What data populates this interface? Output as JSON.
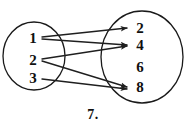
{
  "figure": {
    "caption": "7.",
    "background_color": "#ffffff",
    "ink_color": "#1a1a1a"
  },
  "domain_set": {
    "name": "domain-oval",
    "items": [
      {
        "label": "1",
        "x": 33,
        "y": 38
      },
      {
        "label": "2",
        "x": 33,
        "y": 60
      },
      {
        "label": "3",
        "x": 33,
        "y": 78
      }
    ],
    "ellipse": {
      "cx": 34,
      "cy": 56,
      "rx": 31,
      "ry": 34
    }
  },
  "codomain_set": {
    "name": "codomain-oval",
    "items": [
      {
        "label": "2",
        "x": 140,
        "y": 28
      },
      {
        "label": "4",
        "x": 140,
        "y": 45
      },
      {
        "label": "6",
        "x": 140,
        "y": 67
      },
      {
        "label": "8",
        "x": 140,
        "y": 87
      }
    ],
    "ellipse": {
      "cx": 142,
      "cy": 57,
      "rx": 41,
      "ry": 46
    }
  },
  "chart_data": {
    "type": "diagram",
    "title": "7.",
    "subtype": "arrow-mapping-diagram",
    "domain": [
      "1",
      "2",
      "3"
    ],
    "codomain": [
      "2",
      "4",
      "6",
      "8"
    ],
    "mappings": [
      {
        "from": "1",
        "to": "2",
        "x1": 42,
        "y1": 37,
        "x2": 127,
        "y2": 28
      },
      {
        "from": "1",
        "to": "4",
        "x1": 42,
        "y1": 39,
        "x2": 127,
        "y2": 45
      },
      {
        "from": "2",
        "to": "4",
        "x1": 42,
        "y1": 59,
        "x2": 127,
        "y2": 46
      },
      {
        "from": "2",
        "to": "8",
        "x1": 42,
        "y1": 61,
        "x2": 127,
        "y2": 87
      },
      {
        "from": "3",
        "to": "8",
        "x1": 42,
        "y1": 79,
        "x2": 127,
        "y2": 89
      }
    ],
    "unmapped_codomain": [
      "6"
    ]
  }
}
